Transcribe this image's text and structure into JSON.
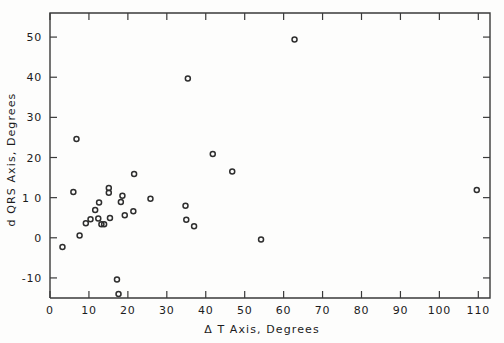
{
  "chart_data": {
    "type": "scatter",
    "title": "",
    "xlabel": "Δ T  Axis,  Degrees",
    "ylabel": "d QRS Axis,  Degrees",
    "xlim": [
      0,
      113
    ],
    "ylim": [
      -15,
      56
    ],
    "xticks": [
      0,
      10,
      20,
      30,
      40,
      50,
      60,
      70,
      80,
      90,
      100,
      110
    ],
    "xticklabels": [
      "0",
      "10",
      "20",
      "30",
      "40",
      "50",
      "60",
      "70",
      "80",
      "90",
      "100",
      "110"
    ],
    "yticks": [
      -10,
      0,
      10,
      20,
      30,
      40,
      50
    ],
    "yticklabels": [
      "-10",
      "0",
      "1 0",
      "20",
      "30",
      "40",
      "50"
    ],
    "grid": false,
    "legend": null,
    "marker": "open-circle",
    "marker_color": "#2e2e2e",
    "points": [
      {
        "x": 3.2,
        "y": -2.3
      },
      {
        "x": 6.0,
        "y": 11.4
      },
      {
        "x": 6.8,
        "y": 24.6
      },
      {
        "x": 7.6,
        "y": 0.6
      },
      {
        "x": 9.2,
        "y": 3.6
      },
      {
        "x": 10.4,
        "y": 4.6
      },
      {
        "x": 11.6,
        "y": 6.9
      },
      {
        "x": 12.4,
        "y": 4.8
      },
      {
        "x": 12.6,
        "y": 8.8
      },
      {
        "x": 13.2,
        "y": 3.4
      },
      {
        "x": 13.9,
        "y": 3.4
      },
      {
        "x": 15.1,
        "y": 12.4
      },
      {
        "x": 15.1,
        "y": 11.2
      },
      {
        "x": 15.4,
        "y": 4.9
      },
      {
        "x": 17.2,
        "y": -10.4
      },
      {
        "x": 17.6,
        "y": -14.0
      },
      {
        "x": 18.2,
        "y": 8.9
      },
      {
        "x": 18.6,
        "y": 10.5
      },
      {
        "x": 19.2,
        "y": 5.6
      },
      {
        "x": 21.4,
        "y": 6.6
      },
      {
        "x": 21.6,
        "y": 15.9
      },
      {
        "x": 25.8,
        "y": 9.7
      },
      {
        "x": 34.8,
        "y": 8.0
      },
      {
        "x": 35.0,
        "y": 4.5
      },
      {
        "x": 35.4,
        "y": 39.7
      },
      {
        "x": 37.0,
        "y": 2.9
      },
      {
        "x": 41.8,
        "y": 20.9
      },
      {
        "x": 46.8,
        "y": 16.5
      },
      {
        "x": 54.2,
        "y": -0.4
      },
      {
        "x": 62.8,
        "y": 49.4
      },
      {
        "x": 109.6,
        "y": 11.9
      }
    ]
  }
}
